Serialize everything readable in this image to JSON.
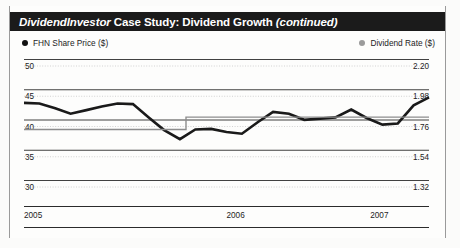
{
  "header": {
    "brand": "DividendInvestor",
    "title": " Case Study: Dividend Growth ",
    "continued": "(continued)"
  },
  "legend": {
    "left": {
      "label": "FHN Share Price ($)",
      "marker": "filled-circle-black",
      "color": "#111111"
    },
    "right": {
      "label": "Dividend Rate ($)",
      "marker": "filled-circle-gray",
      "color": "#9b9b9b"
    }
  },
  "chart_data": {
    "type": "line",
    "xlabel": "",
    "ylabel": "FHN Share Price ($)",
    "y2label": "Dividend Rate ($)",
    "grid": true,
    "legend_position": "top",
    "ylim": [
      30,
      50
    ],
    "y2lim": [
      1.32,
      2.2
    ],
    "yticks": [
      "50",
      "45",
      "40",
      "35",
      "30"
    ],
    "ytick_values": [
      50,
      45,
      40,
      35,
      30
    ],
    "y2ticks": [
      "2.20",
      "1.98",
      "1.76",
      "1.54",
      "1.32"
    ],
    "y2tick_values": [
      2.2,
      1.98,
      1.76,
      1.54,
      1.32
    ],
    "xticks": [
      "2005",
      "2006",
      "2007"
    ],
    "xtick_positions": [
      0,
      0.5,
      0.855
    ],
    "series": [
      {
        "name": "FHN Share Price ($)",
        "axis": "left",
        "color": "#1a1a1a",
        "width": 2.6,
        "x": [
          0.0,
          0.038,
          0.077,
          0.115,
          0.154,
          0.192,
          0.231,
          0.269,
          0.308,
          0.346,
          0.385,
          0.423,
          0.462,
          0.5,
          0.538,
          0.577,
          0.615,
          0.654,
          0.692,
          0.731,
          0.769,
          0.808,
          0.846,
          0.885,
          0.923,
          0.962,
          1.0
        ],
        "values": [
          44.4,
          44.3,
          43.5,
          42.6,
          43.2,
          43.8,
          44.3,
          44.2,
          42.0,
          39.9,
          38.4,
          40.0,
          40.1,
          39.6,
          39.3,
          41.2,
          42.9,
          42.6,
          41.6,
          41.8,
          42.0,
          43.3,
          41.9,
          40.8,
          41.0,
          44.0,
          45.3
        ]
      },
      {
        "name": "Dividend Rate ($)",
        "axis": "right",
        "color": "#8d8d8d",
        "width": 1.4,
        "step": true,
        "x": [
          0.0,
          0.4,
          0.4,
          1.0
        ],
        "values": [
          1.76,
          1.76,
          1.85,
          1.85
        ]
      }
    ]
  }
}
